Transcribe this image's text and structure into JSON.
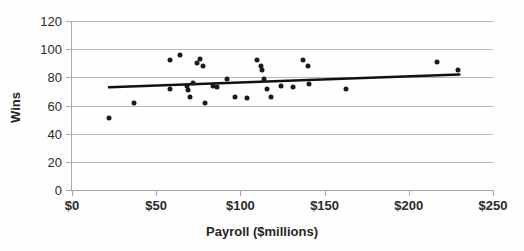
{
  "chart_data": {
    "type": "scatter",
    "title": "",
    "xlabel": "Payroll ($millions)",
    "ylabel": "Wins",
    "xlim": [
      0,
      250
    ],
    "ylim": [
      0,
      120
    ],
    "xticks": [
      "$0",
      "$50",
      "$100",
      "$150",
      "$200",
      "$250"
    ],
    "xtick_values": [
      0,
      50,
      100,
      150,
      200,
      250
    ],
    "yticks": [
      "0",
      "20",
      "40",
      "60",
      "80",
      "100",
      "120"
    ],
    "ytick_values": [
      0,
      20,
      40,
      60,
      80,
      100,
      120
    ],
    "grid": "horizontal",
    "legend": "none",
    "point_color": "#1b1b1b",
    "trendline_color": "#111111",
    "gridline_color": "#b9b9b9",
    "points": [
      {
        "x": 22,
        "y": 51
      },
      {
        "x": 37,
        "y": 62
      },
      {
        "x": 58,
        "y": 92
      },
      {
        "x": 58,
        "y": 72
      },
      {
        "x": 64,
        "y": 96
      },
      {
        "x": 68,
        "y": 74
      },
      {
        "x": 69,
        "y": 71
      },
      {
        "x": 70,
        "y": 66
      },
      {
        "x": 72,
        "y": 76
      },
      {
        "x": 74,
        "y": 90
      },
      {
        "x": 76,
        "y": 93
      },
      {
        "x": 78,
        "y": 88
      },
      {
        "x": 79,
        "y": 62
      },
      {
        "x": 84,
        "y": 74
      },
      {
        "x": 86,
        "y": 73
      },
      {
        "x": 92,
        "y": 79
      },
      {
        "x": 97,
        "y": 66
      },
      {
        "x": 104,
        "y": 65
      },
      {
        "x": 110,
        "y": 92
      },
      {
        "x": 112,
        "y": 88
      },
      {
        "x": 113,
        "y": 85
      },
      {
        "x": 114,
        "y": 79
      },
      {
        "x": 116,
        "y": 72
      },
      {
        "x": 118,
        "y": 66
      },
      {
        "x": 124,
        "y": 74
      },
      {
        "x": 131,
        "y": 73
      },
      {
        "x": 137,
        "y": 92
      },
      {
        "x": 140,
        "y": 88
      },
      {
        "x": 141,
        "y": 75
      },
      {
        "x": 163,
        "y": 72
      },
      {
        "x": 217,
        "y": 91
      },
      {
        "x": 229,
        "y": 85
      }
    ],
    "trendline": {
      "x0": 22,
      "y0": 73,
      "x1": 230,
      "y1": 82
    }
  }
}
